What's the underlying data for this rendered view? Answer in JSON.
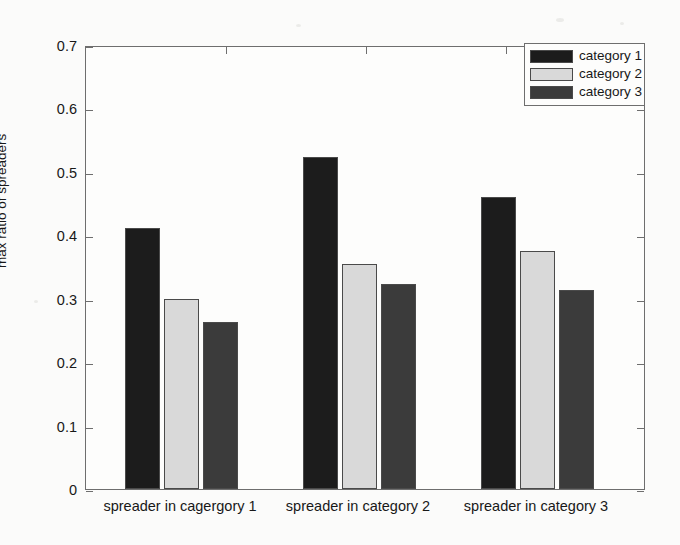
{
  "chart_data": {
    "type": "bar",
    "title": "",
    "xlabel": "",
    "ylabel": "max ratio of spreaders",
    "ylim": [
      0,
      0.7
    ],
    "yticks": [
      0,
      0.1,
      0.2,
      0.3,
      0.4,
      0.5,
      0.6,
      0.7
    ],
    "ytick_labels": [
      "0",
      "0.1",
      "0.2",
      "0.3",
      "0.4",
      "0.5",
      "0.6",
      "0.7"
    ],
    "grid": false,
    "legend_position": "top-right",
    "categories": [
      "spreader in cagergory 1",
      "spreader in category 2",
      "spreader in category 3"
    ],
    "series": [
      {
        "name": "category 1",
        "color": "#1c1c1c",
        "values": [
          0.412,
          0.524,
          0.461
        ]
      },
      {
        "name": "category 2",
        "color": "#d9d9d9",
        "values": [
          0.3,
          0.354,
          0.375
        ]
      },
      {
        "name": "category 3",
        "color": "#3b3b3b",
        "values": [
          0.264,
          0.323,
          0.313
        ]
      }
    ]
  },
  "axes": {
    "y_title": "max ratio of spreaders",
    "ytick_labels": [
      "0.7",
      "0.6",
      "0.5",
      "0.4",
      "0.3",
      "0.2",
      "0.1",
      "0"
    ],
    "xtick_labels": [
      "spreader in cagergory 1",
      "spreader in category 2",
      "spreader in category 3"
    ]
  },
  "legend": {
    "entries": [
      {
        "label": "category 1"
      },
      {
        "label": "category 2"
      },
      {
        "label": "category 3"
      }
    ]
  }
}
